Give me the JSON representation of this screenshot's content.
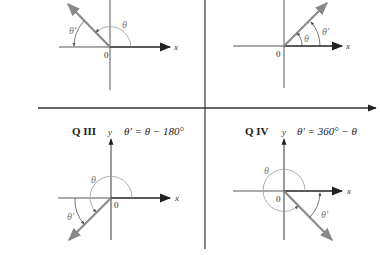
{
  "diagram": {
    "colors": {
      "axis": "#222222",
      "ray": "#8a8a8a",
      "arc": "#999999",
      "divider": "#333333"
    },
    "quadrants": {
      "q2": {
        "name": "Q II",
        "x_label": "x",
        "origin_label": "0",
        "theta_label": "θ",
        "theta_prime_label": "θ′"
      },
      "q1": {
        "name": "Q I",
        "x_label": "x",
        "origin_label": "0",
        "theta_label": "θ",
        "theta_prime_label": "θ′"
      },
      "q3": {
        "name": "Q III",
        "y_label": "y",
        "formula": "θ′ = θ − 180°",
        "x_label": "x",
        "origin_label": "0",
        "theta_label": "θ",
        "theta_prime_label": "θ′"
      },
      "q4": {
        "name": "Q IV",
        "y_label": "y",
        "formula": "θ′ = 360° − θ",
        "x_label": "x",
        "origin_label": "0",
        "theta_label": "θ",
        "theta_prime_label": "θ′"
      }
    }
  }
}
